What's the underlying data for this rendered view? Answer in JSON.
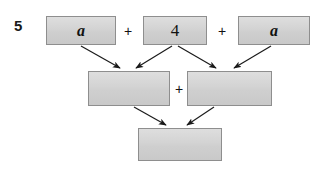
{
  "exercise": {
    "number": "5"
  },
  "diagram": {
    "type": "expression-tree",
    "top_row": {
      "boxes": [
        {
          "id": "top-box-1",
          "label": "a",
          "style": "italic"
        },
        {
          "id": "top-box-2",
          "label": "4",
          "style": "plain"
        },
        {
          "id": "top-box-3",
          "label": "a",
          "style": "italic"
        }
      ],
      "operators": [
        "+",
        "+"
      ]
    },
    "middle_row": {
      "boxes": [
        {
          "id": "middle-box-left",
          "label": "",
          "style": "plain"
        },
        {
          "id": "middle-box-right",
          "label": "",
          "style": "plain"
        }
      ],
      "operators": [
        "+"
      ]
    },
    "bottom_row": {
      "boxes": [
        {
          "id": "bottom-box",
          "label": "",
          "style": "plain"
        }
      ]
    },
    "connections": [
      {
        "from": "top-box-1",
        "to": "middle-box-left"
      },
      {
        "from": "top-box-2",
        "to": "middle-box-left"
      },
      {
        "from": "top-box-2",
        "to": "middle-box-right"
      },
      {
        "from": "top-box-3",
        "to": "middle-box-right"
      },
      {
        "from": "middle-box-left",
        "to": "bottom-box"
      },
      {
        "from": "middle-box-right",
        "to": "bottom-box"
      }
    ],
    "colors": {
      "box_fill_top": "#dedede",
      "box_fill_bottom": "#c9c9c9",
      "box_border": "#8e8e8e",
      "arrow": "#1a1a1a",
      "text": "#111111",
      "background": "#ffffff"
    }
  }
}
